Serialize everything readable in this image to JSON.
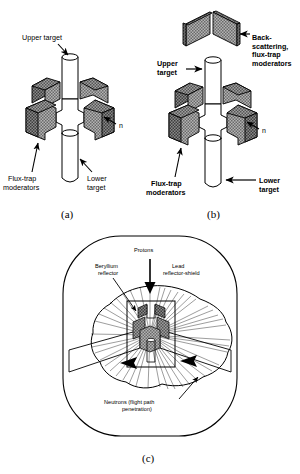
{
  "figure": {
    "background_color": "#ffffff",
    "line_color": "#000000",
    "moderator_fill": "#9a9a9a",
    "moderator_top_fill": "#6e6e6e",
    "moderator_dark_fill": "#575757"
  },
  "panels": [
    {
      "id": "a",
      "caption": "(a)",
      "labels": {
        "upper_target": "Upper target",
        "flux_trap": "Flux-trap\nmoderators",
        "flux_trap_line1": "Flux-trap",
        "flux_trap_line2": "moderators",
        "lower_target_line1": "Lower",
        "lower_target_line2": "target",
        "neutron": "n"
      }
    },
    {
      "id": "b",
      "caption": "(b)",
      "labels": {
        "backscatter_line1": "Back-",
        "backscatter_line2": "scattering,",
        "backscatter_line3": "flux-trap",
        "backscatter_line4": "moderators",
        "upper_target_line1": "Upper",
        "upper_target_line2": "target",
        "flux_trap_line1": "Flux-trap",
        "flux_trap_line2": "moderators",
        "lower_target_line1": "Lower",
        "lower_target_line2": "target",
        "neutron": "n"
      }
    },
    {
      "id": "c",
      "caption": "(c)",
      "labels": {
        "protons": "Protons",
        "beryllium_line1": "Beryllium",
        "beryllium_line2": "reflector",
        "lead_line1": "Lead",
        "lead_line2": "reflector-shield",
        "neutrons_line1": "Neutrons (flight path",
        "neutrons_line2": "penetration)"
      }
    }
  ]
}
